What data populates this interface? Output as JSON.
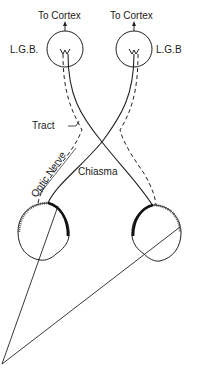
{
  "diagram": {
    "labels": {
      "cortex_left": "To Cortex",
      "cortex_right": "To Cortex",
      "lgb_left": "L.G.B.",
      "lgb_right": "L.G.B",
      "tract": "Tract",
      "optic_nerve": "Optic Nerve",
      "chiasma": "Chiasma"
    },
    "colors": {
      "stroke": "#222222",
      "background": "#ffffff"
    }
  }
}
